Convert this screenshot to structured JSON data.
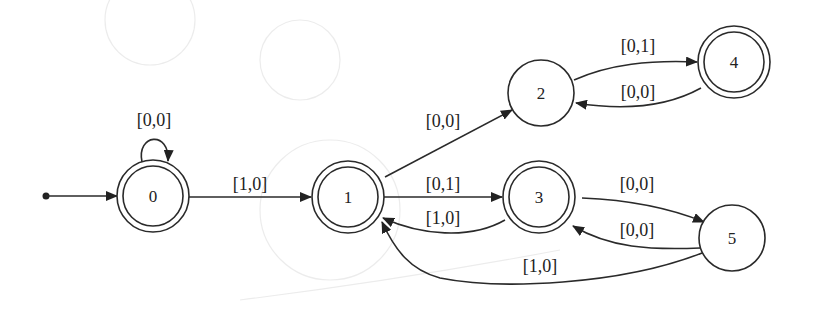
{
  "diagram": {
    "type": "finite-state-automaton",
    "start_state": "0",
    "states": [
      {
        "id": "0",
        "label": "0",
        "accepting": true
      },
      {
        "id": "1",
        "label": "1",
        "accepting": true
      },
      {
        "id": "2",
        "label": "2",
        "accepting": false
      },
      {
        "id": "3",
        "label": "3",
        "accepting": true
      },
      {
        "id": "4",
        "label": "4",
        "accepting": true
      },
      {
        "id": "5",
        "label": "5",
        "accepting": false
      }
    ],
    "transitions": [
      {
        "from": "0",
        "to": "0",
        "label": "[0,0]"
      },
      {
        "from": "0",
        "to": "1",
        "label": "[1,0]"
      },
      {
        "from": "1",
        "to": "2",
        "label": "[0,0]"
      },
      {
        "from": "1",
        "to": "3",
        "label": "[0,1]"
      },
      {
        "from": "3",
        "to": "1",
        "label": "[1,0]"
      },
      {
        "from": "2",
        "to": "4",
        "label": "[0,1]"
      },
      {
        "from": "4",
        "to": "2",
        "label": "[0,0]"
      },
      {
        "from": "3",
        "to": "5",
        "label": "[0,0]"
      },
      {
        "from": "5",
        "to": "3",
        "label": "[0,0]"
      },
      {
        "from": "5",
        "to": "1",
        "label": "[1,0]"
      }
    ]
  }
}
